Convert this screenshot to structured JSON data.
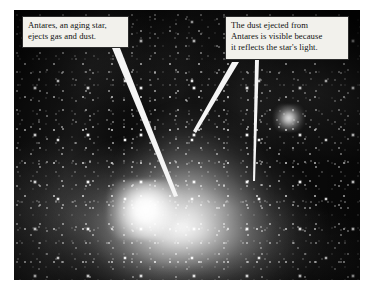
{
  "figure": {
    "type": "annotated-astronomical-photograph",
    "photo": {
      "frame": {
        "x": 14,
        "y": 10,
        "width": 346,
        "height": 270
      },
      "background_color": "#0a0a0a",
      "features": [
        {
          "name": "antares-star-glow",
          "description": "bright white central glow"
        },
        {
          "name": "globular-cluster",
          "description": "compact bright star cluster right of center"
        },
        {
          "name": "starfield",
          "description": "dense field of white point stars"
        },
        {
          "name": "dust-clouds",
          "description": "faint grey reflection-nebula streaks"
        }
      ]
    },
    "callouts": [
      {
        "id": "callout-left",
        "text": "Antares, an aging star,\nejects gas and dust.",
        "box_color": "#f2f1ec",
        "border_color": "#2c2c2c",
        "text_color": "#111111",
        "leader_lines": 1
      },
      {
        "id": "callout-right",
        "text": "The dust ejected from\nAntares is visible because\nit reflects the star's light.",
        "box_color": "#f2f1ec",
        "border_color": "#2c2c2c",
        "text_color": "#111111",
        "leader_lines": 2
      }
    ],
    "leader_line_color": "#f5f5f5"
  }
}
